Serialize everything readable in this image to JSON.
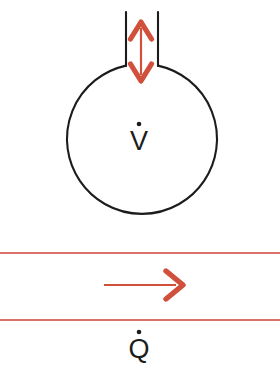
{
  "figure": {
    "background_color": "#ffffff",
    "width": 280,
    "height": 369
  },
  "colors": {
    "outline": "#1c1c1c",
    "accent_red": "#d0503c",
    "channel_line_red": "#d9736a",
    "label_text": "#1c1c1c"
  },
  "vessel": {
    "name": "round-bottom-flask",
    "circle": {
      "cx": 139,
      "cy": 140,
      "r": 75
    },
    "neck": {
      "left_x": 126,
      "right_x": 158,
      "top_y": 12,
      "bottom_y": 66
    }
  },
  "vertical_arrow": {
    "name": "volumetric-flow-arrow",
    "direction": "double-headed-vertical",
    "x": 141,
    "top_y": 22,
    "bottom_y": 81,
    "color": "#d0503c"
  },
  "labels": {
    "volumetric_flow": {
      "symbol": "V",
      "overdot": true,
      "x": 139,
      "y": 150
    },
    "heat_flow": {
      "symbol": "Q",
      "overdot": true,
      "x": 139,
      "y": 358
    }
  },
  "channel": {
    "name": "heat-flow-channel",
    "top_line_y": 253,
    "bottom_line_y": 320,
    "left_x": 0,
    "right_x": 280,
    "line_color": "#d9736a",
    "line_width": 2
  },
  "horizontal_arrow": {
    "name": "heat-flow-arrow",
    "direction": "right",
    "start_x": 104,
    "tip_x": 183,
    "y": 285,
    "color": "#d0503c"
  }
}
